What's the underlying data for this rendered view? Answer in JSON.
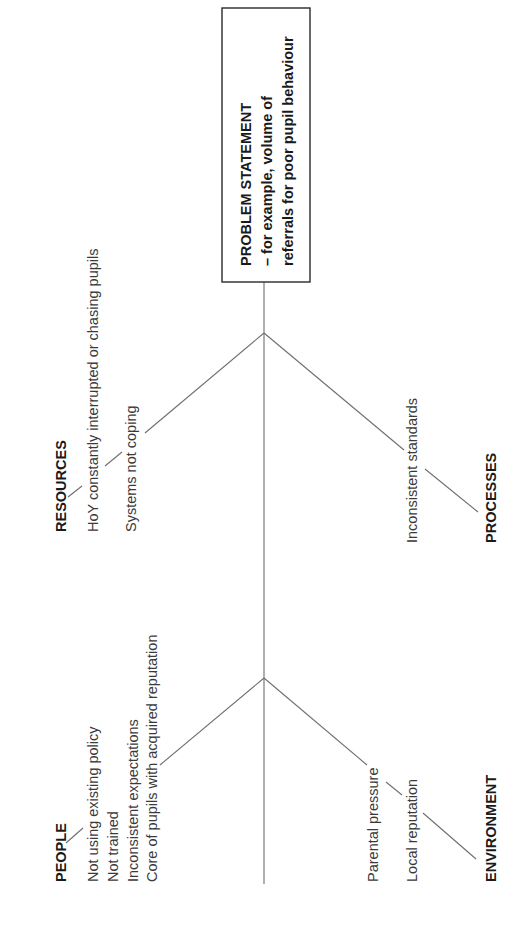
{
  "diagram": {
    "type": "fishbone",
    "orientation": "rotated-90-ccw",
    "problem_statement": {
      "line1": "PROBLEM STATEMENT",
      "line2": "– for example, volume of",
      "line3": "referrals for poor pupil behaviour"
    },
    "categories": {
      "resources": {
        "title": "RESOURCES",
        "items": [
          "HoY constantly interrupted or chasing pupils",
          "Systems not coping"
        ]
      },
      "processes": {
        "title": "PROCESSES",
        "items": [
          "Inconsistent standards"
        ]
      },
      "people": {
        "title": "PEOPLE",
        "items": [
          "Not using existing policy",
          "Not trained",
          "Inconsistent expectations",
          "Core of pupils with acquired reputation"
        ]
      },
      "environment": {
        "title": "ENVIRONMENT",
        "items": [
          "Parental pressure",
          "Local reputation"
        ]
      }
    },
    "colors": {
      "line": "#6e6e6e",
      "box_border": "#2a2a2a",
      "text": "#1a1a1a"
    }
  }
}
